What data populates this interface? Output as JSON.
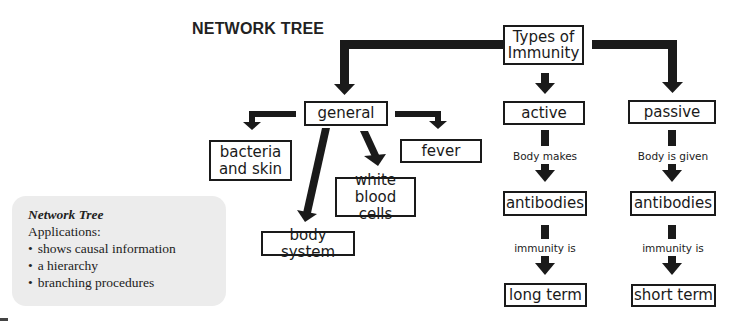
{
  "title": "NETWORK TREE",
  "nodes": {
    "root": "Types of Immunity",
    "general": "general",
    "active": "active",
    "passive": "passive",
    "bacteria": "bacteria and skin",
    "fever": "fever",
    "white_blood_cells": "white blood cells",
    "body_system": "body system",
    "active_antibodies": "antibodies",
    "passive_antibodies": "antibodies",
    "long_term": "long term",
    "short_term": "short term"
  },
  "edge_labels": {
    "active_to_antibodies": "Body makes",
    "passive_to_antibodies": "Body is given",
    "active_antibodies_to_term": "immunity is",
    "passive_antibodies_to_term": "immunity is"
  },
  "note": {
    "heading": "Network Tree",
    "subheading": "Applications:",
    "items": [
      "shows causal information",
      "a hierarchy",
      "branching procedures"
    ]
  },
  "colors": {
    "arrow": "#1a1a1a",
    "note_background": "#ececec",
    "border": "#1a1a1a"
  }
}
